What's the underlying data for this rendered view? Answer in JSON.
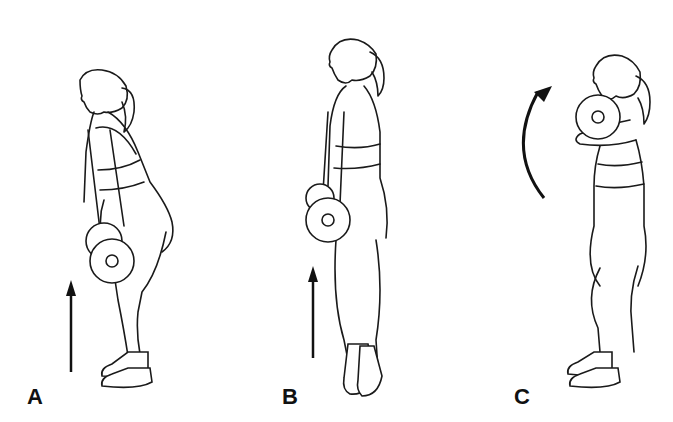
{
  "figure": {
    "panels": [
      {
        "id": "A",
        "label": "A",
        "motion": "upward-arrow",
        "pose": "hinged start, plate at knees"
      },
      {
        "id": "B",
        "label": "B",
        "motion": "upward-arrow",
        "pose": "upright extension on toes, plate at hips"
      },
      {
        "id": "C",
        "label": "C",
        "motion": "curved-upward-arrow",
        "pose": "catch, plate at shoulders"
      }
    ]
  }
}
